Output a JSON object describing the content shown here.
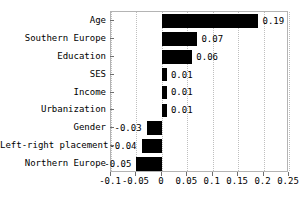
{
  "chart_data": {
    "type": "bar",
    "orientation": "horizontal",
    "title": "",
    "subtitle": "",
    "xlabel": "",
    "ylabel": "",
    "xlim": [
      -0.1,
      0.25
    ],
    "ylim": null,
    "grid": true,
    "grid_axis": "x",
    "grid_style": "dotted",
    "legend": false,
    "legend_position": "none",
    "bar_color": "#000000",
    "background_color": "#ffffff",
    "frame_color": "#b4b4b4",
    "gridline_color": "#bfbfbf",
    "categories": [
      "Age",
      "Southern Europe",
      "Education",
      "SES",
      "Income",
      "Urbanization",
      "Gender",
      "Left-right placement",
      "Northern Europe"
    ],
    "values": [
      0.19,
      0.07,
      0.06,
      0.01,
      0.01,
      0.01,
      -0.03,
      -0.04,
      -0.05
    ],
    "value_labels": [
      "0.19",
      "0.07",
      "0.06",
      "0.01",
      "0.01",
      "0.01",
      "-0.03",
      "-0.04",
      "-0.05"
    ],
    "xticks": [
      -0.1,
      -0.05,
      0,
      0.05,
      0.1,
      0.15,
      0.2,
      0.25
    ],
    "xtick_labels": [
      "-0.1",
      "-0.05",
      "0",
      "0.05",
      "0.1",
      "0.15",
      "0.2",
      "0.25"
    ]
  }
}
